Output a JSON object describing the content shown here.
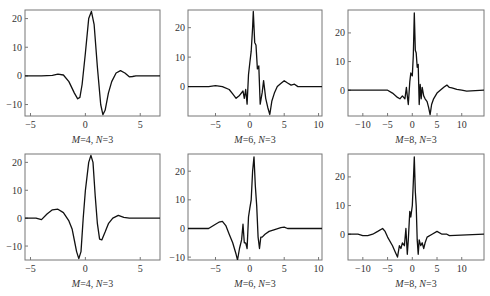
{
  "figure": {
    "rows": 2,
    "cols": 3,
    "line_color": "#111111",
    "frame_color": "#777777"
  },
  "chart_data": [
    {
      "type": "line",
      "panel": "row1-col1",
      "caption": "M=4, N=3",
      "caption_parts": {
        "M": "4",
        "N": "3"
      },
      "xlim": [
        -5.5,
        6.8
      ],
      "ylim": [
        -14,
        23
      ],
      "xticks": [
        -5,
        0,
        5
      ],
      "yticks": [
        -10,
        0,
        10,
        20
      ],
      "frame": {
        "x": 25,
        "y": 10,
        "w": 135,
        "h": 106
      },
      "x": [
        -5.5,
        -4,
        -3,
        -2.5,
        -2,
        -1.5,
        -1,
        -0.7,
        -0.5,
        -0.3,
        0,
        0.3,
        0.55,
        0.8,
        1.1,
        1.4,
        1.6,
        1.8,
        2.1,
        2.4,
        2.8,
        3.2,
        3.6,
        4,
        4.3,
        4.6,
        5,
        6.8
      ],
      "y": [
        0,
        0,
        0.2,
        0.6,
        0.3,
        -2,
        -6,
        -8,
        -7.5,
        -3,
        8,
        20,
        22.5,
        18,
        3,
        -10,
        -13.5,
        -12,
        -6,
        -2,
        1,
        1.8,
        1,
        -0.3,
        -0.2,
        0,
        0,
        0
      ],
      "grid": false
    },
    {
      "type": "line",
      "panel": "row1-col2",
      "caption": "M=6, N=3",
      "caption_parts": {
        "M": "6",
        "N": "3"
      },
      "xlim": [
        -9,
        10.5
      ],
      "ylim": [
        -10,
        26
      ],
      "xticks": [
        -5,
        0,
        5,
        10
      ],
      "yticks": [
        0,
        10,
        20
      ],
      "frame": {
        "x": 188,
        "y": 10,
        "w": 134,
        "h": 106
      },
      "x": [
        -9,
        -6,
        -5,
        -4,
        -3,
        -2.5,
        -2,
        -1.5,
        -1,
        -0.8,
        -0.6,
        -0.4,
        -0.2,
        0,
        0.2,
        0.4,
        0.5,
        0.7,
        0.9,
        1.1,
        1.3,
        1.5,
        1.8,
        2,
        2.3,
        2.6,
        2.9,
        3.2,
        3.6,
        4,
        4.5,
        5,
        5.5,
        6,
        6.5,
        7,
        8,
        10.5
      ],
      "y": [
        0,
        0,
        0.3,
        0,
        -1,
        -2.5,
        -4,
        -3,
        -1.5,
        -4,
        -1,
        -6,
        4,
        8,
        12,
        20,
        25.5,
        15,
        14,
        6,
        7,
        -6,
        -2,
        2,
        -4,
        -7,
        -9.5,
        -5,
        -2,
        0,
        1,
        2,
        1.2,
        0.5,
        0.8,
        0,
        0,
        0
      ],
      "grid": false
    },
    {
      "type": "line",
      "panel": "row1-col3",
      "caption": "M=8, N=3",
      "caption_parts": {
        "M": "8",
        "N": "3"
      },
      "xlim": [
        -13,
        14.5
      ],
      "ylim": [
        -9,
        28
      ],
      "xticks": [
        -10,
        -5,
        0,
        5,
        10
      ],
      "yticks": [
        0,
        10,
        20
      ],
      "frame": {
        "x": 348,
        "y": 10,
        "w": 136,
        "h": 106
      },
      "x": [
        -13,
        -7,
        -6,
        -5,
        -4,
        -3,
        -2.5,
        -2,
        -1.5,
        -1.2,
        -1,
        -0.8,
        -0.5,
        -0.3,
        0,
        0.2,
        0.4,
        0.6,
        0.8,
        1,
        1.2,
        1.4,
        1.6,
        1.8,
        2,
        2.3,
        2.6,
        3,
        3.3,
        3.6,
        3.9,
        4.3,
        5,
        6,
        6.5,
        7,
        7.5,
        8,
        9,
        10,
        11,
        14.5
      ],
      "y": [
        0,
        0,
        0,
        0,
        -1,
        -2.5,
        -3,
        -2,
        -3,
        1,
        -2,
        -5,
        3,
        6,
        5,
        12,
        27,
        14,
        13,
        8,
        9,
        -5,
        2,
        -3,
        1,
        -2,
        -3,
        -4,
        -6,
        -8.5,
        -5,
        -3,
        -1,
        0.5,
        1.2,
        1.8,
        1,
        0.8,
        0.3,
        0,
        -0.3,
        0
      ],
      "grid": false
    },
    {
      "type": "line",
      "panel": "row2-col1",
      "caption": "M=4, N=3",
      "caption_parts": {
        "M": "4",
        "N": "3"
      },
      "xlim": [
        -5.5,
        6.8
      ],
      "ylim": [
        -15,
        23
      ],
      "xticks": [
        -5,
        0,
        5
      ],
      "yticks": [
        -10,
        0,
        10,
        20
      ],
      "frame": {
        "x": 25,
        "y": 154,
        "w": 135,
        "h": 106
      },
      "x": [
        -5.5,
        -4.5,
        -4,
        -3.5,
        -3,
        -2.5,
        -2,
        -1.5,
        -1.2,
        -1,
        -0.8,
        -0.6,
        -0.4,
        -0.2,
        0,
        0.3,
        0.5,
        0.7,
        0.9,
        1.1,
        1.3,
        1.5,
        1.8,
        2.1,
        2.5,
        3,
        3.5,
        4,
        6.8
      ],
      "y": [
        0,
        0,
        -0.5,
        1.5,
        3,
        3.2,
        2,
        -1,
        -4,
        -8,
        -12,
        -14.5,
        -12,
        0,
        10,
        20,
        22.5,
        20,
        8,
        -2,
        -7.5,
        -7.8,
        -5,
        -2,
        0,
        1,
        0.3,
        0,
        0
      ],
      "grid": false
    },
    {
      "type": "line",
      "panel": "row2-col2",
      "caption": "M=6, N=3",
      "caption_parts": {
        "M": "6",
        "N": "3"
      },
      "xlim": [
        -9,
        10.5
      ],
      "ylim": [
        -11,
        26
      ],
      "xticks": [
        -5,
        0,
        5,
        10
      ],
      "yticks": [
        -10,
        0,
        10,
        20
      ],
      "frame": {
        "x": 188,
        "y": 154,
        "w": 134,
        "h": 106
      },
      "x": [
        -9,
        -7,
        -6,
        -5,
        -4.5,
        -4,
        -3.5,
        -3,
        -2.5,
        -2,
        -1.8,
        -1.5,
        -1.2,
        -1,
        -0.8,
        -0.6,
        -0.4,
        -0.2,
        0,
        0.2,
        0.4,
        0.6,
        0.8,
        1,
        1.2,
        1.4,
        1.6,
        1.8,
        2.2,
        2.8,
        3.5,
        4.5,
        5,
        5.5,
        6,
        10.5
      ],
      "y": [
        0,
        0,
        0,
        1.5,
        2.2,
        2.5,
        1,
        -2,
        -5,
        -9,
        -11,
        -7,
        -4,
        1.5,
        -5,
        -5,
        -7,
        4,
        7,
        10,
        20,
        25,
        15,
        8,
        -3,
        -7,
        -3,
        -3,
        -2,
        -1,
        -0.5,
        0.3,
        0.5,
        0,
        0,
        0
      ],
      "grid": false
    },
    {
      "type": "line",
      "panel": "row2-col3",
      "caption": "M=8, N=3",
      "caption_parts": {
        "M": "8",
        "N": "3"
      },
      "xlim": [
        -13,
        14.5
      ],
      "ylim": [
        -9,
        28
      ],
      "xticks": [
        -10,
        -5,
        0,
        5,
        10
      ],
      "yticks": [
        0,
        10,
        20
      ],
      "frame": {
        "x": 348,
        "y": 154,
        "w": 136,
        "h": 106
      },
      "x": [
        -13,
        -11,
        -10,
        -9,
        -8,
        -7,
        -6,
        -5.5,
        -5,
        -4,
        -3.5,
        -3,
        -2.6,
        -2.3,
        -2,
        -1.6,
        -1.3,
        -1,
        -0.8,
        -0.5,
        -0.3,
        0,
        0.2,
        0.4,
        0.6,
        0.8,
        1,
        1.2,
        1.4,
        1.7,
        2,
        2.3,
        2.6,
        3,
        4,
        5,
        6,
        7,
        7.5,
        14.5
      ],
      "y": [
        0,
        0,
        -0.5,
        -0.5,
        0,
        1,
        2,
        1,
        -1,
        -4,
        -6,
        -8,
        -4,
        -5,
        -3,
        -4,
        2,
        -7,
        -2,
        8,
        6,
        10,
        18,
        27,
        15,
        10,
        -2,
        -7,
        -2,
        -4,
        -3,
        -5,
        -3,
        -1,
        0,
        1,
        0,
        0,
        -0.5,
        0
      ],
      "grid": false
    }
  ]
}
